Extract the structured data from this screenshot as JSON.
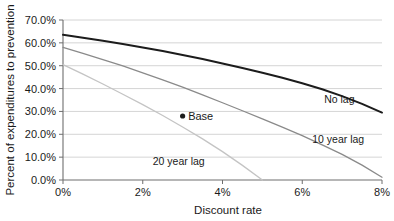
{
  "chart_data": {
    "type": "line",
    "title": "",
    "xlabel": "Discount rate",
    "ylabel": "Percent of expenditures to prevention",
    "xlim": [
      0,
      8
    ],
    "ylim": [
      0,
      70
    ],
    "grid": true,
    "legend_position": "inline-annotations",
    "x_tick_labels": [
      "0%",
      "2%",
      "4%",
      "6%",
      "8%"
    ],
    "x_ticks": [
      0,
      2,
      4,
      6,
      8
    ],
    "y_tick_labels": [
      "0.0%",
      "10.0%",
      "20.0%",
      "30.0%",
      "40.0%",
      "50.0%",
      "60.0%",
      "70.0%"
    ],
    "y_ticks": [
      0,
      10,
      20,
      30,
      40,
      50,
      60,
      70
    ],
    "series": [
      {
        "name": "No lag",
        "color": "#1c1c1c",
        "width": 2.0,
        "label": "No lag",
        "label_x": 6.55,
        "label_y": 33.5,
        "x": [
          0,
          0.5,
          1,
          1.5,
          2,
          2.5,
          3,
          3.5,
          4,
          4.5,
          5,
          5.5,
          6,
          6.5,
          7,
          7.5,
          8
        ],
        "values": [
          63.5,
          62.2,
          60.9,
          59.5,
          58.0,
          56.4,
          54.7,
          52.9,
          51.0,
          49.0,
          46.9,
          44.7,
          42.3,
          39.7,
          36.7,
          33.3,
          29.5
        ]
      },
      {
        "name": "10 year lag",
        "color": "#8a8a8a",
        "width": 1.3,
        "label": "10 year lag",
        "label_x": 6.25,
        "label_y": 16.0,
        "x": [
          0,
          0.5,
          1,
          1.5,
          2,
          2.5,
          3,
          3.5,
          4,
          4.5,
          5,
          5.5,
          6,
          6.5,
          7,
          7.5,
          8
        ],
        "values": [
          58.0,
          55.4,
          52.7,
          49.9,
          46.9,
          43.8,
          40.6,
          37.2,
          33.8,
          30.3,
          26.7,
          23.1,
          19.4,
          15.4,
          11.2,
          6.5,
          1.2
        ]
      },
      {
        "name": "20 year lag",
        "color": "#c4c4c4",
        "width": 1.3,
        "label": "20 year lag",
        "label_x": 2.25,
        "label_y": 6.5,
        "x": [
          0,
          0.5,
          1,
          1.5,
          2,
          2.5,
          3,
          3.5,
          4,
          4.5,
          5
        ],
        "values": [
          50.5,
          46.3,
          42.0,
          37.5,
          33.0,
          28.2,
          23.2,
          18.0,
          12.4,
          6.4,
          0.0
        ]
      }
    ],
    "annotations": [
      {
        "name": "Base",
        "label": "Base",
        "x": 3.0,
        "y": 28.0,
        "marker": "dot",
        "color": "#1c1c1c"
      }
    ]
  }
}
